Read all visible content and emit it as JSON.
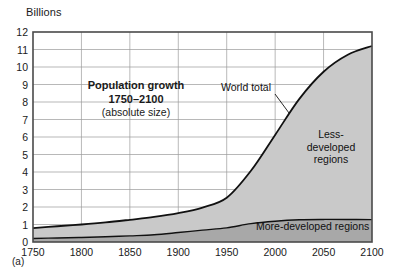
{
  "figure": {
    "panel_label": "(a)",
    "y_axis_unit": "Billions",
    "title_lines": {
      "line1": "Population growth",
      "line2": "1750–2100",
      "line3": "(absolute size)"
    },
    "annotations": {
      "world_total": "World total",
      "less_developed_l1": "Less-",
      "less_developed_l2": "developed",
      "less_developed_l3": "regions",
      "more_developed": "More-developed regions"
    },
    "colors": {
      "less_developed_fill": "#c9c9c9",
      "more_developed_fill": "#a8a8a8",
      "grid": "#9a9a9a",
      "frame": "#4a4a4a",
      "curve": "#111111",
      "background": "#ffffff"
    }
  },
  "chart_data": {
    "type": "area",
    "title": "Population growth 1750–2100 (absolute size)",
    "xlabel": "",
    "ylabel": "Billions",
    "xlim": [
      1750,
      2100
    ],
    "ylim": [
      0,
      12
    ],
    "grid": true,
    "legend": "in-plot labels",
    "x_tick_labels": [
      "1750",
      "1800",
      "1850",
      "1900",
      "1950",
      "2000",
      "2050",
      "2100"
    ],
    "y_tick_labels": [
      "0",
      "1",
      "2",
      "3",
      "4",
      "5",
      "6",
      "7",
      "8",
      "9",
      "10",
      "11",
      "12"
    ],
    "x": [
      1750,
      1775,
      1800,
      1825,
      1850,
      1875,
      1900,
      1925,
      1950,
      1975,
      2000,
      2025,
      2050,
      2075,
      2100
    ],
    "series": [
      {
        "name": "World total",
        "stacked": false,
        "values": [
          0.79,
          0.9,
          1.0,
          1.12,
          1.27,
          1.43,
          1.65,
          1.97,
          2.53,
          4.07,
          6.12,
          8.18,
          9.73,
          10.7,
          11.2
        ]
      },
      {
        "name": "More-developed regions",
        "stacked": false,
        "values": [
          0.2,
          0.23,
          0.26,
          0.3,
          0.35,
          0.41,
          0.54,
          0.68,
          0.81,
          1.05,
          1.19,
          1.27,
          1.29,
          1.29,
          1.28
        ]
      },
      {
        "name": "Less-developed regions",
        "stacked": false,
        "values": [
          0.59,
          0.67,
          0.74,
          0.82,
          0.92,
          1.02,
          1.11,
          1.29,
          1.72,
          3.02,
          4.93,
          6.91,
          8.44,
          9.41,
          9.92
        ]
      }
    ]
  }
}
